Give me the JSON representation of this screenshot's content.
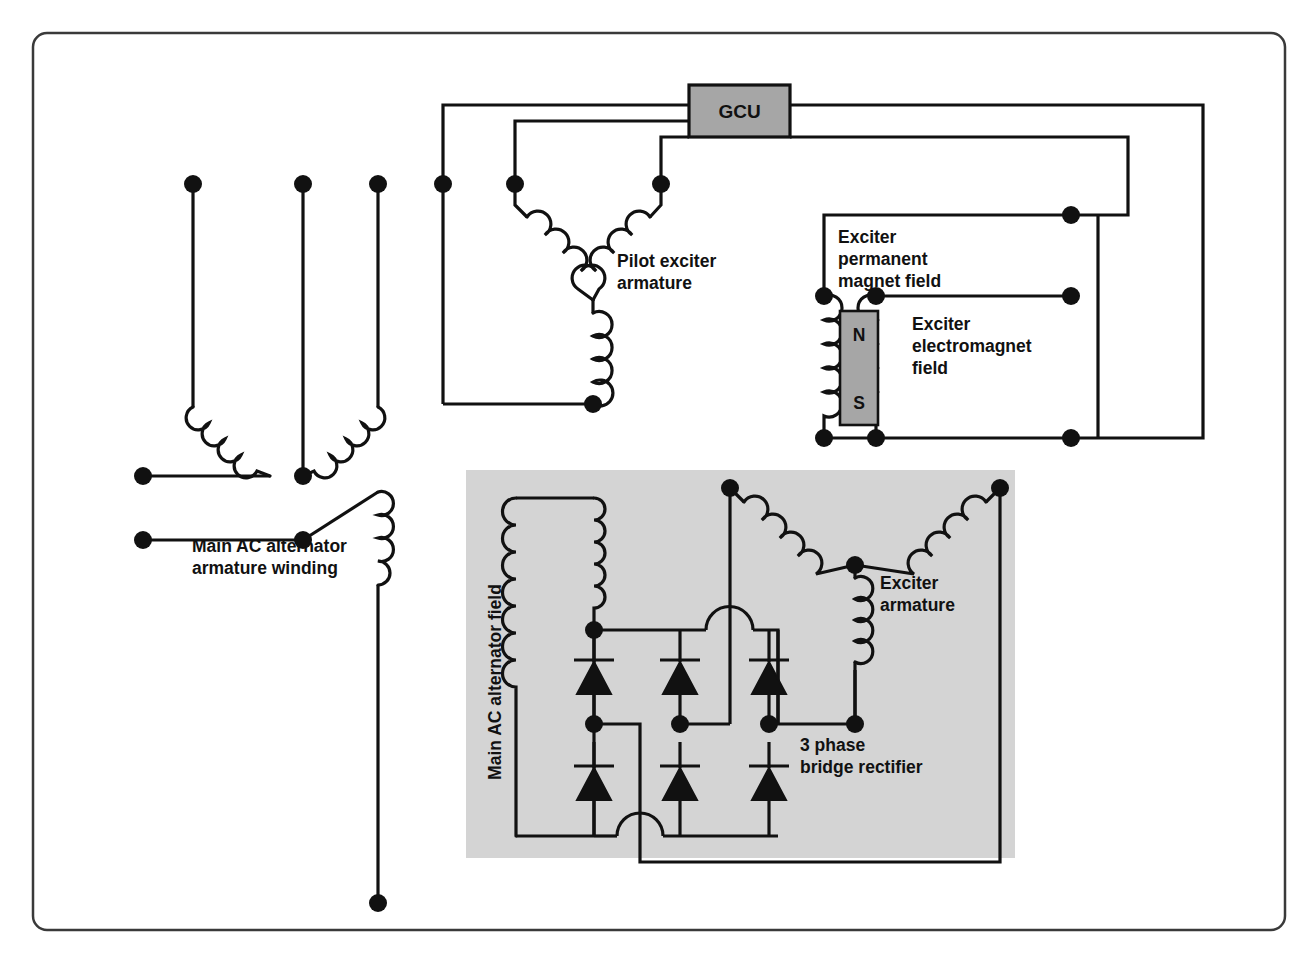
{
  "diagram": {
    "frame": {
      "stroke": "#3a3a3a",
      "fill": "#ffffff",
      "corner_radius": 14
    },
    "colors": {
      "wire": "#111111",
      "node": "#111111",
      "gcu_fill": "#a6a6a6",
      "magnet_fill": "#a6a6a6",
      "panel_fill": "#d4d4d4",
      "background": "#ffffff",
      "text": "#111111"
    },
    "blocks": {
      "gcu": {
        "label": "GCU"
      },
      "magnet": {
        "north_label": "N",
        "south_label": "S"
      }
    },
    "labels": {
      "pilot_exciter": [
        "Pilot exciter",
        "armature"
      ],
      "exciter_permanent_magnet_field": [
        "Exciter",
        "permanent",
        "magnet field"
      ],
      "exciter_electromagnet_field": [
        "Exciter",
        "electromagnet",
        "field"
      ],
      "main_ac_alternator_armature_winding": [
        "Main AC alternator",
        "armature winding"
      ],
      "main_ac_alternator_field": "Main AC alternator field",
      "exciter_armature": [
        "Exciter",
        "armature"
      ],
      "three_phase_bridge_rectifier": [
        "3 phase",
        "bridge rectifier"
      ]
    },
    "components": {
      "diode_count": 6,
      "phase_count": 3,
      "terminal_dot_radius": 9
    }
  }
}
